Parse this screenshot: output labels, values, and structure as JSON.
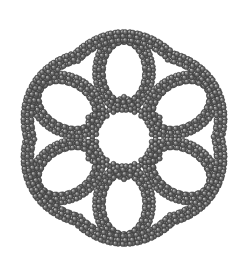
{
  "image": {
    "kind": "molecular-structure-render",
    "title": "Hexagonal macrocyclic nanoring molecular model",
    "width": 245,
    "height": 264,
    "background_color": "#ffffff",
    "render_style": "ball-and-stick",
    "symmetry": "C6 (six-fold rotational)",
    "alt_text": "Gray ball-and-stick molecular model of a flower-shaped macrocycle with a central hexagonal cavity surrounded by six petal-shaped rings built from linked hexagonal aromatic units."
  },
  "palette": {
    "atom_fill": "#6e6e6e",
    "atom_fill_dark": "#4d4d4d",
    "atom_highlight": "#b9b9b9",
    "atom_edge": "#3c3c3c",
    "bond_color": "#6a6a6a",
    "bond_edge": "#4a4a4a",
    "background": "#ffffff"
  },
  "geometry": {
    "center_x": 124,
    "center_y": 138,
    "overall_bbox": {
      "x": 18,
      "y": 20,
      "width": 207,
      "height": 232
    },
    "central_cavity_radius": 30,
    "lobe_count": 6,
    "lobe_center_radius": 66,
    "lobe_rx": 25,
    "lobe_ry": 34,
    "lobe_start_angle_deg": -90,
    "outer_ring_radius": 100,
    "atom_radius": 2.6,
    "bond_width": 2.1,
    "ring_unit_radius": 4.6,
    "units_per_central_edge": 3,
    "units_per_lobe": 13,
    "units_per_outer_arc": 15
  },
  "chemistry": {
    "repeat_unit": "para-phenylene",
    "repeat_unit_shape": "hexagon",
    "atom_element": "C",
    "ring_vertices": 6
  },
  "labels": {
    "caption": ""
  }
}
